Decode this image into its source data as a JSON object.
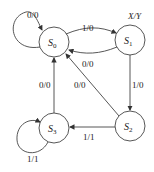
{
  "legend": "X/Y",
  "states": [
    {
      "id": "S0",
      "name": "S",
      "sub": "0"
    },
    {
      "id": "S1",
      "name": "S",
      "sub": "1"
    },
    {
      "id": "S2",
      "name": "S",
      "sub": "2"
    },
    {
      "id": "S3",
      "name": "S",
      "sub": "3"
    }
  ],
  "transitions": [
    {
      "from": "S0",
      "to": "S0",
      "label": "0/0"
    },
    {
      "from": "S0",
      "to": "S1",
      "label": "1/0"
    },
    {
      "from": "S1",
      "to": "S0",
      "label": "0/0"
    },
    {
      "from": "S1",
      "to": "S2",
      "label": "1/0"
    },
    {
      "from": "S2",
      "to": "S0",
      "label": "0/0"
    },
    {
      "from": "S2",
      "to": "S3",
      "label": "1/1"
    },
    {
      "from": "S3",
      "to": "S0",
      "label": "0/0"
    },
    {
      "from": "S3",
      "to": "S3",
      "label": "1/1"
    }
  ]
}
